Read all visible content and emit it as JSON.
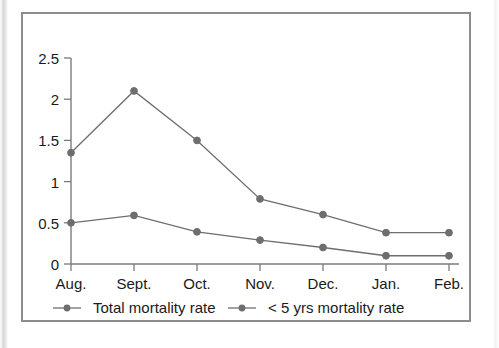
{
  "figure": {
    "frame_border_color": "#8c8c8c",
    "background_color": "#ffffff"
  },
  "chart_data": {
    "type": "line",
    "title": "",
    "subtitle": "",
    "xlabel": "",
    "ylabel": "",
    "categories": [
      "Aug.",
      "Sept.",
      "Oct.",
      "Nov.",
      "Dec.",
      "Jan.",
      "Feb."
    ],
    "yticks": [
      "0",
      "0.5",
      "1",
      "1.5",
      "2",
      "2.5"
    ],
    "ytick_values": [
      0,
      0.5,
      1,
      1.5,
      2,
      2.5
    ],
    "ylim": [
      0,
      2.5
    ],
    "grid": false,
    "legend_position": "bottom",
    "series": [
      {
        "name": "Total mortality rate",
        "color": "#6e6e6e",
        "marker": "circle",
        "values": [
          1.35,
          2.1,
          1.5,
          0.79,
          0.6,
          0.38,
          0.38
        ]
      },
      {
        "name": "< 5 yrs mortality rate",
        "color": "#6e6e6e",
        "marker": "circle",
        "values": [
          0.5,
          0.59,
          0.39,
          0.29,
          0.2,
          0.1,
          0.1
        ]
      }
    ]
  },
  "legend": {
    "entries": [
      {
        "label": "Total mortality rate"
      },
      {
        "label": "< 5 yrs mortality rate"
      }
    ]
  },
  "axis": {
    "y_tick_labels": [
      "2.5",
      "2",
      "1.5",
      "1",
      "0.5",
      "0"
    ],
    "x_tick_labels": [
      "Aug.",
      "Sept.",
      "Oct.",
      "Nov.",
      "Dec.",
      "Jan.",
      "Feb."
    ]
  }
}
